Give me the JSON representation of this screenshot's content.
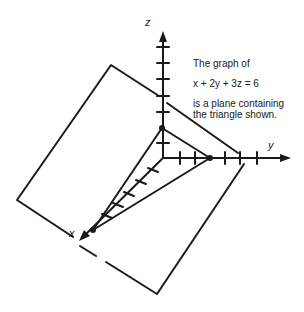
{
  "figure": {
    "axes": {
      "x_label": "x",
      "y_label": "y",
      "z_label": "z"
    },
    "caption": {
      "line1": "The graph of",
      "equation": "x  + 2y  + 3z  = 6",
      "line3": "is a plane containing",
      "line4": "the triangle shown."
    },
    "intercepts": {
      "x": 6,
      "y": 3,
      "z": 2
    },
    "colors": {
      "stroke": "#1a1a1a",
      "background": "#ffffff"
    }
  }
}
